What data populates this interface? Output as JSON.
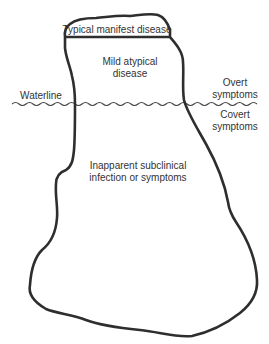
{
  "diagram": {
    "type": "iceberg",
    "labels": {
      "top": "Typical manifest disease",
      "mild": [
        "Mild atypical",
        "disease"
      ],
      "waterline": "Waterline",
      "overt": [
        "Overt",
        "symptoms"
      ],
      "covert": [
        "Covert",
        "symptoms"
      ],
      "inapparent": [
        "Inapparent subclinical",
        "infection or symptoms"
      ]
    },
    "colors": {
      "stroke": "#2e2e2e",
      "background": "#ffffff",
      "text": "#333333"
    }
  }
}
